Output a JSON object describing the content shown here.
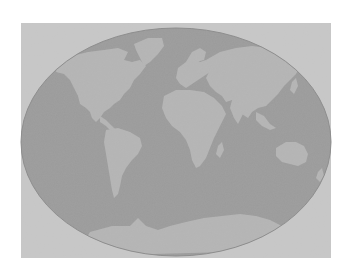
{
  "map": {
    "projection": "elliptical world map",
    "colors": {
      "page_background": "#ffffff",
      "frame_background": "#c8c8c8",
      "ocean": "#9b9b9b",
      "land": "#b5b5b5",
      "ocean_edge": "#8e8e8e"
    },
    "frame": {
      "x": 21,
      "y": 23,
      "width": 310,
      "height": 235
    },
    "ellipse": {
      "cx": 176,
      "cy": 142,
      "rx": 155,
      "ry": 114
    },
    "regions": [
      {
        "name": "North America"
      },
      {
        "name": "Greenland"
      },
      {
        "name": "South America"
      },
      {
        "name": "Europe"
      },
      {
        "name": "Africa"
      },
      {
        "name": "Asia"
      },
      {
        "name": "Australia"
      },
      {
        "name": "Antarctica"
      }
    ]
  }
}
